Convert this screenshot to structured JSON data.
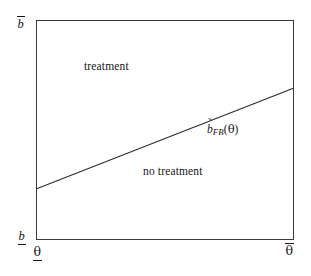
{
  "figure": {
    "background_color": "#ffffff",
    "line_color": "#2b2b2b",
    "frame_color": "#3a3a3a",
    "text_color": "#161616"
  },
  "axes": {
    "y_max_label": "b",
    "y_max_accent": "overbar",
    "y_min_label": "b",
    "y_min_accent": "underbar",
    "x_min_label": "θ",
    "x_min_accent": "underbar",
    "x_max_label": "θ",
    "x_max_accent": "overbar"
  },
  "regions": {
    "above_label": "treatment",
    "below_label": "no treatment"
  },
  "curve": {
    "base_symbol": "b",
    "accent": "˜",
    "subscript": "FB",
    "open_paren": "(",
    "argument": "θ",
    "close_paren": ")",
    "full_label": "b̃_FB(θ)"
  },
  "chart_data": {
    "type": "line",
    "title": "",
    "xlabel": "θ",
    "ylabel": "b",
    "xlim": [
      0,
      1
    ],
    "ylim": [
      0,
      1
    ],
    "grid": false,
    "legend": "none",
    "series": [
      {
        "name": "b̃_FB(θ)",
        "x": [
          0,
          1
        ],
        "y": [
          0.232,
          0.691
        ],
        "style": "solid",
        "color": "#2b2b2b",
        "annotation": "b̃_FB(θ)"
      }
    ],
    "annotations": [
      {
        "text": "treatment",
        "x": 0.24,
        "y": 0.78,
        "region": "above-line"
      },
      {
        "text": "no treatment",
        "x": 0.5,
        "y": 0.31,
        "region": "below-line"
      },
      {
        "text": "b̃_FB(θ)",
        "x": 0.7,
        "y": 0.51,
        "region": "curve-label"
      }
    ],
    "tick_labels": {
      "x": [
        "θ (underbar)",
        "θ (overbar)"
      ],
      "y": [
        "b (underbar)",
        "b (overbar)"
      ]
    }
  }
}
